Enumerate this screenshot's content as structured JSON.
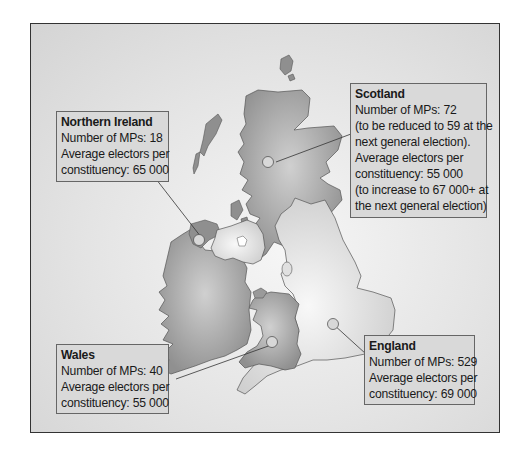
{
  "map": {
    "title": "UK parliamentary representation",
    "regions": {
      "northern_ireland": {
        "name": "Northern Ireland",
        "lines": [
          "Number of MPs: 18",
          "Average electors per",
          "constituency: 65 000"
        ],
        "mps": 18,
        "avg_electors": 65000
      },
      "scotland": {
        "name": "Scotland",
        "lines": [
          "Number of MPs: 72",
          "(to be reduced to 59 at the",
          "next general election).",
          "Average electors per",
          "constituency: 55 000",
          "(to increase to 67 000+ at",
          "the next general election)"
        ],
        "mps": 72,
        "avg_electors": 55000
      },
      "wales": {
        "name": "Wales",
        "lines": [
          "Number of MPs: 40",
          "Average electors per",
          "constituency: 55 000"
        ],
        "mps": 40,
        "avg_electors": 55000
      },
      "england": {
        "name": "England",
        "lines": [
          "Number of MPs: 529",
          "Average electors per",
          "constituency: 69 000"
        ],
        "mps": 529,
        "avg_electors": 69000
      }
    },
    "colors": {
      "dark_land": "#9a9a9a",
      "light_land": "#e0e0e0",
      "box_fill": "#d9d9d9",
      "border": "#333333"
    }
  }
}
